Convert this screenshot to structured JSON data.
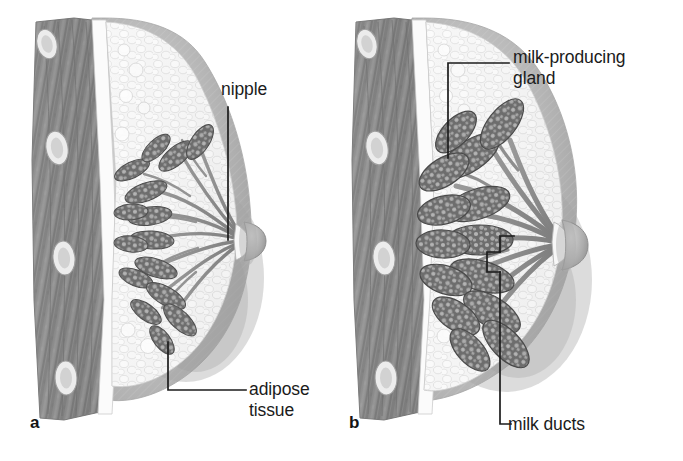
{
  "figure": {
    "background_color": "#ffffff",
    "width": 683,
    "height": 461
  },
  "panels": [
    {
      "id": "a",
      "letter": "a",
      "caption": "a",
      "state": "non-lactating breast",
      "nipple_position": {
        "x": 247,
        "y": 240
      }
    },
    {
      "id": "b",
      "letter": "b",
      "caption": "b",
      "state": "lactating breast with enlarged milk-producing glands",
      "nipple_position": {
        "x": 567,
        "y": 245
      }
    }
  ],
  "labels": [
    {
      "id": "nipple",
      "text": "nipple",
      "panel": "a",
      "leader": "vertical line down from text to nipple tip"
    },
    {
      "id": "milk-producing-gland",
      "line1": "milk-producing",
      "line2": "gland",
      "text": "milk-producing gland",
      "panel": "b",
      "leader": "horizontal dash then vertical line down to gland lobule"
    },
    {
      "id": "adipose-tissue",
      "line1": "adipose",
      "line2": "tissue",
      "text": "adipose tissue",
      "panel": "a",
      "leader": "horizontal dash left then vertical line up into fatty tissue"
    },
    {
      "id": "milk-ducts",
      "text": "milk ducts",
      "panel": "b",
      "leader": "L-corner then long vertical line up to duct bracket"
    }
  ],
  "anatomy": {
    "structures": [
      "rib",
      "pectoral muscle",
      "fascia",
      "adipose tissue",
      "milk-producing gland (lobule)",
      "milk duct",
      "lactiferous sinus",
      "nipple",
      "areola",
      "skin"
    ]
  },
  "colors": {
    "background": "#ffffff",
    "text": "#1b1b1b",
    "leader_line": "#202020",
    "skin_shade": "#b8b8b8",
    "skin_shade_dark": "#9a9a9a",
    "muscle": "#8f8f8f",
    "muscle_dark": "#6e6e6e",
    "rib": "#e8e8e8",
    "adipose": "#f2f2f2",
    "adipose_outline": "#c9c9c9",
    "gland": "#767676",
    "gland_dark": "#5a5a5a",
    "gland_speckle": "#c8c8c8",
    "duct": "#8a8a8a",
    "fascia": "#fafafa"
  }
}
